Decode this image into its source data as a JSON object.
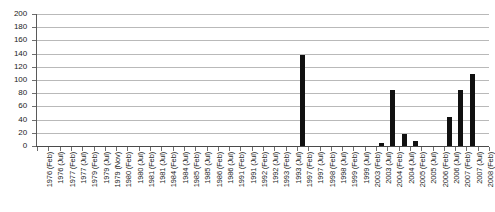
{
  "chart_data": {
    "type": "bar",
    "title": "",
    "xlabel": "",
    "ylabel": "",
    "ylim": [
      0,
      200
    ],
    "ytick_step": 20,
    "grid": true,
    "legend": false,
    "bar_color": "#101010",
    "yticks": [
      200,
      180,
      160,
      140,
      120,
      100,
      80,
      60,
      40,
      20,
      0
    ],
    "categories": [
      "1976 (Feb)",
      "1976 (Jul)",
      "1977 (Feb)",
      "1977 (Jul)",
      "1979 (Feb)",
      "1979 (Jul)",
      "1979 (Nov)",
      "1980 (Feb)",
      "1980 (Jul)",
      "1981 (Feb)",
      "1981 (Jul)",
      "1984 (Feb)",
      "1984 (Jul)",
      "1985 (Feb)",
      "1985 (Jul)",
      "1986 (Feb)",
      "1986 (Jul)",
      "1991 (Feb)",
      "1991 (Jul)",
      "1992 (Feb)",
      "1992 (Jul)",
      "1993 (Feb)",
      "1993 (Jul)",
      "1997 (Feb)",
      "1997 (Jul)",
      "1998 (Feb)",
      "1998 (Jul)",
      "1999 (Feb)",
      "1999 (Jul)",
      "2003 (Feb)",
      "2003 (Jul)",
      "2004 (Feb)",
      "2004 (Jul)",
      "2005 (Feb)",
      "2005 (Jul)",
      "2006 (Feb)",
      "2006 (Jul)",
      "2007 (Feb)",
      "2007 (Jul)",
      "2008 (Feb)"
    ],
    "values": [
      0,
      0,
      0,
      0,
      0,
      0,
      0,
      0,
      0,
      0,
      0,
      0,
      0,
      0,
      0,
      0,
      0,
      0,
      0,
      0,
      0,
      0,
      0,
      138,
      0,
      0,
      0,
      0,
      0,
      0,
      5,
      85,
      18,
      8,
      0,
      0,
      44,
      85,
      109,
      0
    ]
  }
}
